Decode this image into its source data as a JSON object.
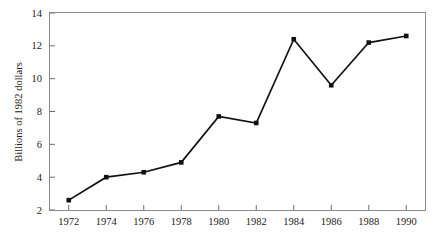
{
  "chart_data": {
    "type": "line",
    "title": "",
    "xlabel": "",
    "ylabel": "Billions of 1982 dollars",
    "categories": [
      "1972",
      "1974",
      "1976",
      "1978",
      "1980",
      "1982",
      "1984",
      "1986",
      "1988",
      "1990"
    ],
    "x": [
      1972,
      1974,
      1976,
      1978,
      1980,
      1982,
      1984,
      1986,
      1988,
      1990
    ],
    "values": [
      2.6,
      4.0,
      4.3,
      4.9,
      7.7,
      7.3,
      12.4,
      9.6,
      12.2,
      12.6
    ],
    "series": [
      {
        "name": "",
        "values": [
          2.6,
          4.0,
          4.3,
          4.9,
          7.7,
          7.3,
          12.4,
          9.6,
          12.2,
          12.6
        ]
      }
    ],
    "xlim": [
      1971,
      1991
    ],
    "ylim": [
      2,
      14
    ],
    "xticks": [
      1972,
      1974,
      1976,
      1978,
      1980,
      1982,
      1984,
      1986,
      1988,
      1990
    ],
    "xtick_labels": [
      "1972",
      "1974",
      "1976",
      "1978",
      "1980",
      "1982",
      "1984",
      "1986",
      "1988",
      "1990"
    ],
    "yticks": [
      2,
      4,
      6,
      8,
      10,
      12,
      14
    ],
    "ytick_labels": [
      "2",
      "4",
      "6",
      "8",
      "10",
      "12",
      "14"
    ],
    "grid": false,
    "legend": false,
    "legend_position": "none",
    "marker": "square",
    "line_color": "#111111",
    "marker_color": "#111111",
    "frame_color": "#8a8a8a",
    "background_color": "#ffffff"
  },
  "axes": {
    "y_title": "Billions of 1982 dollars"
  }
}
